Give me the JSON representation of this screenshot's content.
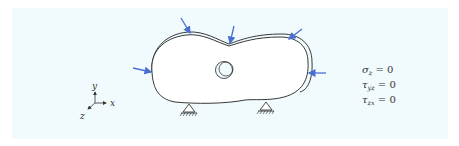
{
  "figure": {
    "background_color": "#f1fbfd",
    "body_outline_color": "#222222",
    "load_arrow_color": "#4a6fd0",
    "axes": {
      "x_label": "x",
      "y_label": "y",
      "z_label": "z"
    },
    "boundary_conditions": [
      {
        "symbol": "σ",
        "subscript": "z",
        "rhs": "= 0"
      },
      {
        "symbol": "τ",
        "subscript": "yz",
        "rhs": "= 0"
      },
      {
        "symbol": "τ",
        "subscript": "zx",
        "rhs": "= 0"
      }
    ],
    "load_arrows_count": 6,
    "supports_count": 2,
    "support_type": "pin"
  }
}
